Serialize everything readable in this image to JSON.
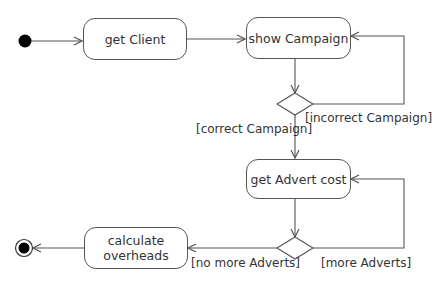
{
  "diagram": {
    "type": "UML activity diagram",
    "colors": {
      "line": "#555555",
      "text": "#333333",
      "node_fill": "#000000",
      "background": "#ffffff"
    },
    "initial_node": {
      "name": "start"
    },
    "final_node": {
      "name": "end"
    },
    "actions": [
      {
        "id": "get_client",
        "label": "get Client"
      },
      {
        "id": "show_campaign",
        "label": "show Campaign"
      },
      {
        "id": "get_advert_cost",
        "label": "get Advert cost"
      },
      {
        "id": "calculate_overheads",
        "label": "calculate overheads",
        "lines": [
          "calculate",
          "overheads"
        ]
      }
    ],
    "decisions": [
      {
        "id": "decision_campaign",
        "guards": [
          "[correct Campaign]",
          "[incorrect Campaign]"
        ]
      },
      {
        "id": "decision_adverts",
        "guards": [
          "[no more Adverts]",
          "[more Adverts]"
        ]
      }
    ],
    "flows": [
      {
        "from": "start",
        "to": "get_client"
      },
      {
        "from": "get_client",
        "to": "show_campaign"
      },
      {
        "from": "show_campaign",
        "to": "decision_campaign"
      },
      {
        "from": "decision_campaign",
        "to": "show_campaign",
        "guard": "[incorrect Campaign]"
      },
      {
        "from": "decision_campaign",
        "to": "get_advert_cost",
        "guard": "[correct Campaign]"
      },
      {
        "from": "get_advert_cost",
        "to": "decision_adverts"
      },
      {
        "from": "decision_adverts",
        "to": "get_advert_cost",
        "guard": "[more Adverts]"
      },
      {
        "from": "decision_adverts",
        "to": "calculate_overheads",
        "guard": "[no more Adverts]"
      },
      {
        "from": "calculate_overheads",
        "to": "end"
      }
    ]
  }
}
